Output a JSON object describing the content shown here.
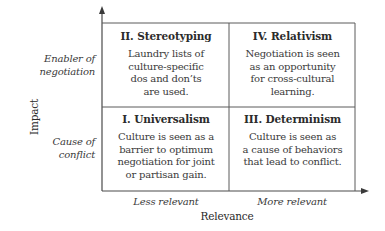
{
  "diagram": {
    "y_axis": {
      "title": "Impact",
      "levels": [
        "Enabler of negotiation",
        "Cause of conflict"
      ],
      "level_lines": [
        [
          "Enabler of",
          "negotiation"
        ],
        [
          "Cause of",
          "conflict"
        ]
      ]
    },
    "x_axis": {
      "title": "Relevance",
      "levels": [
        "Less relevant",
        "More relevant"
      ]
    },
    "quadrants": [
      {
        "id": "II",
        "title": "II. Stereotyping",
        "lines": [
          "Laundry lists of",
          "culture-specific",
          "dos and don’ts",
          "are used."
        ],
        "position": "top-left"
      },
      {
        "id": "IV",
        "title": "IV. Relativism",
        "lines": [
          "Negotiation is seen",
          "as an opportunity",
          "for cross-cultural",
          "learning."
        ],
        "position": "top-right"
      },
      {
        "id": "I",
        "title": "I. Universalism",
        "lines": [
          "Culture is seen as a",
          "barrier to optimum",
          "negotiation for joint",
          "or partisan gain."
        ],
        "position": "bottom-left"
      },
      {
        "id": "III",
        "title": "III. Determinism",
        "lines": [
          "Culture is seen as",
          "a cause of behaviors",
          "that lead to conflict."
        ],
        "position": "bottom-right"
      }
    ],
    "colors": {
      "line": "#4a4a4a",
      "text": "#2a2a2a",
      "background": "#ffffff"
    }
  }
}
